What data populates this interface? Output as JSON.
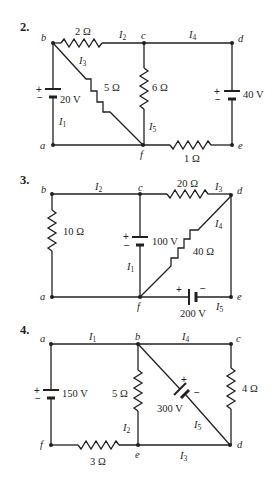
{
  "problems": [
    {
      "number": "2.",
      "nodes": {
        "a": "a",
        "b": "b",
        "c": "c",
        "d": "d",
        "e": "e",
        "f": "f"
      },
      "resistors": {
        "bc": "2 Ω",
        "bf": "5 Ω",
        "cf": "6 Ω",
        "fe": "1 Ω"
      },
      "sources": {
        "ab": {
          "label": "20 V",
          "plus": "+",
          "minus": "−"
        },
        "de": {
          "label": "40 V",
          "plus": "+",
          "minus": "−"
        }
      },
      "currents": {
        "I1": {
          "main": "I",
          "sub": "1"
        },
        "I2": {
          "main": "I",
          "sub": "2"
        },
        "I3": {
          "main": "I",
          "sub": "3"
        },
        "I4": {
          "main": "I",
          "sub": "4"
        },
        "I5": {
          "main": "I",
          "sub": "5"
        }
      }
    },
    {
      "number": "3.",
      "nodes": {
        "a": "a",
        "b": "b",
        "c": "c",
        "d": "d",
        "e": "e",
        "f": "f"
      },
      "resistors": {
        "ab": "10 Ω",
        "cd": "20 Ω",
        "df": "40 Ω"
      },
      "sources": {
        "cf": {
          "label": "100 V",
          "plus": "+",
          "minus": "−"
        },
        "fe": {
          "label": "200 V",
          "plus": "+",
          "minus": "−"
        }
      },
      "currents": {
        "I1": {
          "main": "I",
          "sub": "1"
        },
        "I2": {
          "main": "I",
          "sub": "2"
        },
        "I3": {
          "main": "I",
          "sub": "3"
        },
        "I4": {
          "main": "I",
          "sub": "4"
        },
        "I5": {
          "main": "I",
          "sub": "5"
        }
      }
    },
    {
      "number": "4.",
      "nodes": {
        "a": "a",
        "b": "b",
        "c": "c",
        "d": "d",
        "e": "e",
        "f": "f"
      },
      "resistors": {
        "be": "5 Ω",
        "cd": "4 Ω",
        "fe": "3 Ω"
      },
      "sources": {
        "af": {
          "label": "150 V",
          "plus": "+",
          "minus": "−"
        },
        "bd": {
          "label": "300 V",
          "plus": "+",
          "minus": "−"
        }
      },
      "currents": {
        "I1": {
          "main": "I",
          "sub": "1"
        },
        "I2": {
          "main": "I",
          "sub": "2"
        },
        "I3": {
          "main": "I",
          "sub": "3"
        },
        "I4": {
          "main": "I",
          "sub": "4"
        },
        "I5": {
          "main": "I",
          "sub": "5"
        }
      }
    }
  ]
}
